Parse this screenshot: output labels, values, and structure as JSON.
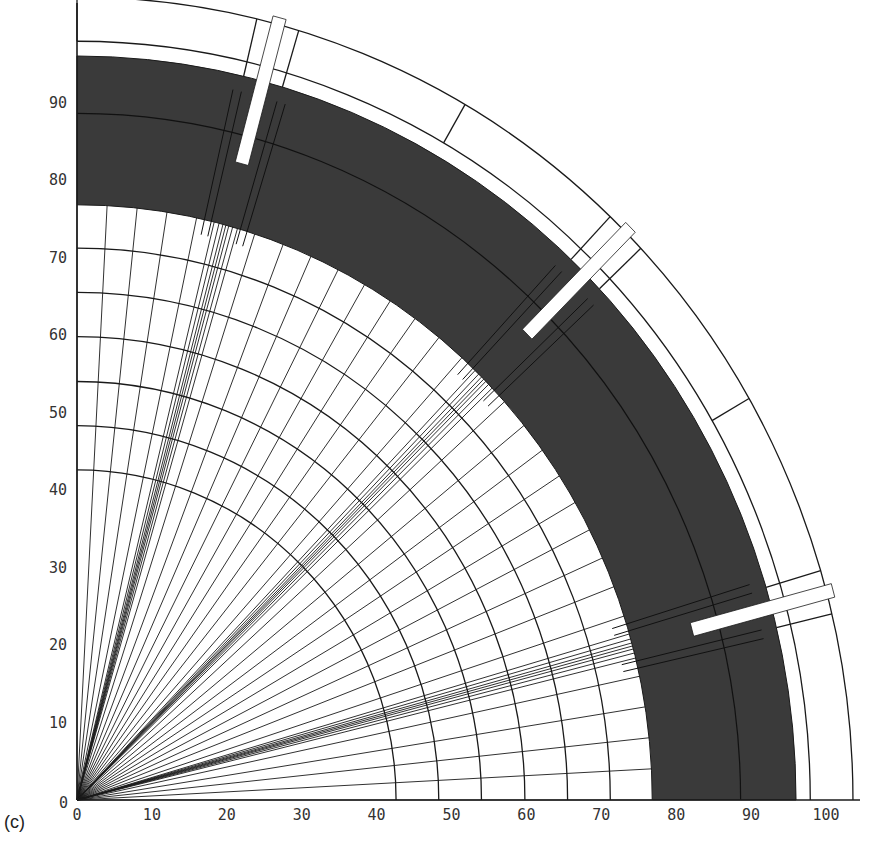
{
  "figure": {
    "panel_label": "(c)"
  },
  "colors": {
    "line": "#1a1a1a",
    "shaded_band": "#3a3a3a",
    "background": "#ffffff",
    "tick_text": "#333333"
  },
  "chart_data": {
    "type": "diagram",
    "title": "",
    "xlabel": "",
    "ylabel": "",
    "xlim": [
      0,
      105
    ],
    "ylim": [
      0,
      103
    ],
    "x_ticks": [
      "0",
      "10",
      "20",
      "30",
      "40",
      "50",
      "60",
      "70",
      "80",
      "90",
      "100"
    ],
    "y_ticks": [
      "0",
      "10",
      "20",
      "30",
      "40",
      "50",
      "60",
      "70",
      "80",
      "90"
    ],
    "grid": false,
    "inner_mesh": {
      "outer_radius": 76.8,
      "arc_radii": [
        42.6,
        48.3,
        54.0,
        59.8,
        65.5,
        71.2
      ],
      "radial_spacing_deg": 3,
      "refined_clusters_deg": [
        15,
        45,
        75
      ],
      "cluster_line_offsets_deg": [
        -1.2,
        -0.7,
        -0.3,
        0.3,
        0.7,
        1.2
      ]
    },
    "shaded_band": {
      "inner_radius": 76.8,
      "outer_radius": 96.0,
      "internal_arc_radius": 88.6
    },
    "outer_band": {
      "inner_radius": 97.9,
      "mid_radius": 98.8,
      "outer_radius": 103.6,
      "dividers_deg": [
        30,
        60
      ]
    },
    "slits": {
      "angles_deg": [
        15,
        45,
        75
      ],
      "width": 1.8,
      "inner_radius": 85.0,
      "outer_radius": 104.5
    }
  }
}
